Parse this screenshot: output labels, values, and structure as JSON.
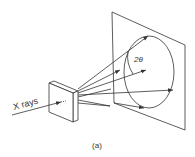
{
  "figure": {
    "caption": "(a)",
    "incident_label": "X rays",
    "angle_label": "2θ",
    "colors": {
      "stroke": "#333333",
      "background": "#ffffff"
    }
  }
}
